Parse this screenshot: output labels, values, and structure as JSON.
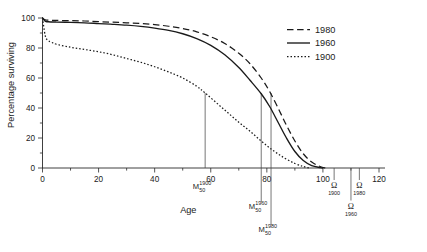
{
  "chart_data": {
    "type": "line",
    "title": "",
    "xlabel": "Age",
    "ylabel": "Percentage surviving",
    "xlim": [
      0,
      120
    ],
    "ylim": [
      0,
      100
    ],
    "xticks": [
      0,
      20,
      40,
      60,
      80,
      100,
      120
    ],
    "xtick_labels": [
      "0",
      "20",
      "40",
      "60",
      "80",
      "100",
      "120"
    ],
    "xminor_ticks": [
      10,
      30,
      50,
      70,
      90,
      110
    ],
    "yticks": [
      0,
      20,
      40,
      60,
      80,
      100
    ],
    "ytick_labels": [
      "0",
      "20",
      "40",
      "60",
      "80",
      "100"
    ],
    "yminor_ticks": [
      10,
      30,
      50,
      70,
      90
    ],
    "grid": false,
    "legend_position": "top-right",
    "series": [
      {
        "name": "1980",
        "style": "dashed",
        "color": "#1a1a1a",
        "x": [
          0,
          1,
          2,
          5,
          10,
          15,
          20,
          25,
          30,
          35,
          40,
          45,
          50,
          55,
          60,
          65,
          70,
          74,
          78,
          81,
          84,
          87,
          90,
          93,
          96,
          99,
          101
        ],
        "y": [
          100,
          98.8,
          98.6,
          98.4,
          98.2,
          98.0,
          97.6,
          97.2,
          96.8,
          96.3,
          95.6,
          94.5,
          93.0,
          90.8,
          87.5,
          83.0,
          76.5,
          69.5,
          60.0,
          51.0,
          40.0,
          28.5,
          18.0,
          9.5,
          4.0,
          1.0,
          0
        ]
      },
      {
        "name": "1960",
        "style": "solid",
        "color": "#1a1a1a",
        "x": [
          0,
          1,
          2,
          5,
          10,
          15,
          20,
          25,
          30,
          35,
          40,
          45,
          50,
          55,
          60,
          65,
          70,
          74,
          78,
          81,
          84,
          87,
          90,
          93,
          96,
          99,
          100
        ],
        "y": [
          100,
          97.8,
          97.5,
          97.3,
          97.1,
          96.8,
          96.3,
          95.8,
          95.2,
          94.4,
          93.3,
          91.8,
          89.5,
          86.3,
          81.8,
          75.5,
          67.0,
          58.5,
          49.5,
          41.0,
          30.5,
          20.0,
          11.0,
          5.0,
          1.6,
          0.3,
          0
        ]
      },
      {
        "name": "1900",
        "style": "dotted",
        "color": "#1a1a1a",
        "x": [
          0,
          1,
          2,
          3,
          5,
          10,
          15,
          20,
          25,
          30,
          35,
          40,
          45,
          50,
          55,
          58,
          62,
          66,
          70,
          74,
          78,
          82,
          86,
          90,
          93,
          95
        ],
        "y": [
          100,
          88.0,
          85.0,
          84.0,
          82.5,
          80.5,
          79.0,
          77.5,
          75.5,
          73.0,
          70.5,
          67.5,
          64.0,
          60.0,
          54.5,
          50.0,
          43.5,
          37.0,
          30.5,
          24.5,
          18.0,
          12.0,
          7.0,
          3.0,
          1.0,
          0
        ]
      }
    ],
    "annotations": [
      {
        "name": "median-1900",
        "base": "M",
        "superscript": "1900",
        "subscript": "50",
        "x": 58,
        "y": 50,
        "kind": "median"
      },
      {
        "name": "median-1960",
        "base": "M",
        "superscript": "1960",
        "subscript": "50",
        "x": 78,
        "y": 50,
        "kind": "median"
      },
      {
        "name": "median-1980",
        "base": "M",
        "superscript": "1980",
        "subscript": "50",
        "x": 81.5,
        "y": 50,
        "kind": "median"
      },
      {
        "name": "omega-1900",
        "base": "Ω",
        "subscript": "1900",
        "x": 104,
        "kind": "omega"
      },
      {
        "name": "omega-1960",
        "base": "Ω",
        "subscript": "1960",
        "x": 110,
        "kind": "omega"
      },
      {
        "name": "omega-1980",
        "base": "Ω",
        "subscript": "1980",
        "x": 113,
        "kind": "omega"
      }
    ]
  },
  "axes": {
    "x_title": "Age",
    "y_title": "Percentage surviving"
  },
  "legend": {
    "entries": [
      {
        "label": "1980",
        "style": "dashed"
      },
      {
        "label": "1960",
        "style": "solid"
      },
      {
        "label": "1900",
        "style": "dotted"
      }
    ]
  },
  "colors": {
    "ink": "#1a1a1a",
    "axis": "#2a2a2a",
    "background": "#ffffff"
  }
}
